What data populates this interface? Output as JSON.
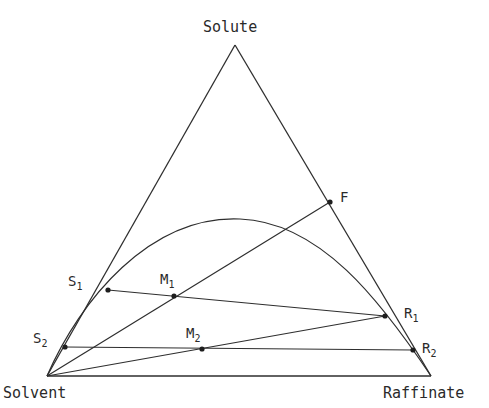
{
  "diagram": {
    "type": "ternary-phase-diagram",
    "vertices": {
      "top": {
        "label": "Solute",
        "x": 235,
        "y": 45,
        "label_x": 203,
        "label_y": 32
      },
      "left": {
        "label": "Solvent",
        "x": 47,
        "y": 376,
        "label_x": 3,
        "label_y": 398
      },
      "right": {
        "label": "Raffinate",
        "x": 431,
        "y": 376,
        "label_x": 383,
        "label_y": 398
      }
    },
    "points": [
      {
        "id": "F",
        "label": "F",
        "sub": "",
        "x": 330,
        "y": 202,
        "label_x": 340,
        "label_y": 202
      },
      {
        "id": "S1",
        "label": "S",
        "sub": "1",
        "x": 108,
        "y": 290,
        "label_x": 68,
        "label_y": 286
      },
      {
        "id": "S2",
        "label": "S",
        "sub": "2",
        "x": 65,
        "y": 347,
        "label_x": 33,
        "label_y": 343
      },
      {
        "id": "M1",
        "label": "M",
        "sub": "1",
        "x": 174,
        "y": 296,
        "label_x": 160,
        "label_y": 284
      },
      {
        "id": "M2",
        "label": "M",
        "sub": "2",
        "x": 202,
        "y": 349,
        "label_x": 186,
        "label_y": 338
      },
      {
        "id": "R1",
        "label": "R",
        "sub": "1",
        "x": 385,
        "y": 316,
        "label_x": 404,
        "label_y": 318
      },
      {
        "id": "R2",
        "label": "R",
        "sub": "2",
        "x": 413,
        "y": 350,
        "label_x": 422,
        "label_y": 353
      }
    ],
    "lines": [
      {
        "name": "solvent-to-F",
        "from": "Solvent",
        "to": "F"
      },
      {
        "name": "solvent-to-R1",
        "from": "Solvent",
        "to": "R1"
      },
      {
        "name": "tie-line-S1-R1",
        "from": "S1",
        "to": "R1",
        "through": "M1"
      },
      {
        "name": "tie-line-S2-R2",
        "from": "S2",
        "to": "R2",
        "through": "M2"
      }
    ],
    "binodal_curve": {
      "path": "M 47 376 C 80 300, 150 215, 240 219 C 320 222, 380 300, 431 376",
      "peak": {
        "x": 238,
        "y": 219
      }
    },
    "colors": {
      "ink": "#2e2e2e",
      "background": "#ffffff"
    }
  }
}
